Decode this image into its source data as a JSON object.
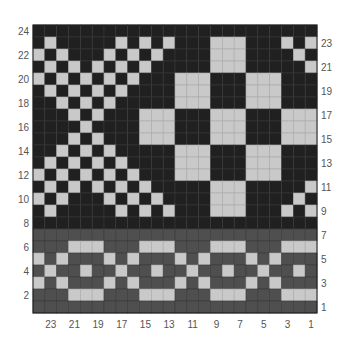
{
  "chart_data": {
    "type": "heatmap",
    "title": "",
    "xlabel": "",
    "ylabel": "",
    "grid": true,
    "columns": 24,
    "rows": 24,
    "legend": {
      "D": "dark (background, upper panel)",
      "G": "medium gray (background, lower band)",
      "L": "light (contrast stitch)"
    },
    "colors": {
      "D": "#202020",
      "G": "#4f4f4f",
      "L": "#c9c9c9",
      "gridline": "#3a3a3a",
      "gridline_light": "#a9a9a9",
      "label": "#555555"
    },
    "row_labels_left": [
      "24",
      "22",
      "20",
      "18",
      "16",
      "14",
      "12",
      "10",
      "8",
      "6",
      "4",
      "2"
    ],
    "row_labels_right": [
      "23",
      "21",
      "19",
      "17",
      "15",
      "13",
      "11",
      "9",
      "7",
      "5",
      "3",
      "1"
    ],
    "col_labels_bottom": [
      "23",
      "21",
      "19",
      "17",
      "15",
      "13",
      "11",
      "9",
      "7",
      "5",
      "3",
      "1"
    ],
    "grid_rows": [
      {
        "row": 24,
        "cells": "DDDDDDDDDDDDDDDDDDDDDDDD"
      },
      {
        "row": 23,
        "cells": "DLDDDDDLDLDLDDDLLLDDDLDL"
      },
      {
        "row": 22,
        "cells": "LDLDDDLDLDLDDDDLLLDDDDLD"
      },
      {
        "row": 21,
        "cells": "DLDLDLDLDLDDDDDLLLDDDDDL"
      },
      {
        "row": 20,
        "cells": "LDLDLDLDLDDDLLLDDDLLLDDD"
      },
      {
        "row": 19,
        "cells": "DLDLDLDLDDDDLLLDDDLLLDDD"
      },
      {
        "row": 18,
        "cells": "DDLDLDLDDDDDLLLDDDLLLDDD"
      },
      {
        "row": 17,
        "cells": "DDDLDLDDDLLLDDDLLLDDDLLL"
      },
      {
        "row": 16,
        "cells": "DDDDLDDDDLLLDDDLLLDDDLLL"
      },
      {
        "row": 15,
        "cells": "DDDLDLDDDLLLDDDLLLDDDLLL"
      },
      {
        "row": 14,
        "cells": "DDLDLDLDDDDDLLLDDDLLLDDD"
      },
      {
        "row": 13,
        "cells": "DLDLDLDLDDDDLLLDDDLLLDDD"
      },
      {
        "row": 12,
        "cells": "LDLDLDLDLDDDLLLDDDLLLDDD"
      },
      {
        "row": 11,
        "cells": "DLDLDLDLDLDDDDDLLLDDDDDL"
      },
      {
        "row": 10,
        "cells": "LDLDDDLDLDLDDDDLLLDDDDLD"
      },
      {
        "row": 9,
        "cells": "DLDDDDDLDLDLDDDLLLDDDLDL"
      },
      {
        "row": 8,
        "cells": "DDDDDDDDDDDDDDDDDDDDDDDD"
      },
      {
        "row": 7,
        "cells": "GGGGGGGGGGGGGGGGGGGGGGGG"
      },
      {
        "row": 6,
        "cells": "GGGLLLGGGLLLGGGLLLGGGLLL"
      },
      {
        "row": 5,
        "cells": "LGLGGGLGLGGGLGLGGGLGLGGG"
      },
      {
        "row": 4,
        "cells": "GLGGLGGLGGLGGLGGLGGLGGLG"
      },
      {
        "row": 3,
        "cells": "LGLGGGLGLGGGLGLGGGLGLGGG"
      },
      {
        "row": 2,
        "cells": "GGGLLLGGGLLLGGGLLLGGGLLL"
      },
      {
        "row": 1,
        "cells": "GGGGGGGGGGGGGGGGGGGGGGGG"
      }
    ]
  }
}
